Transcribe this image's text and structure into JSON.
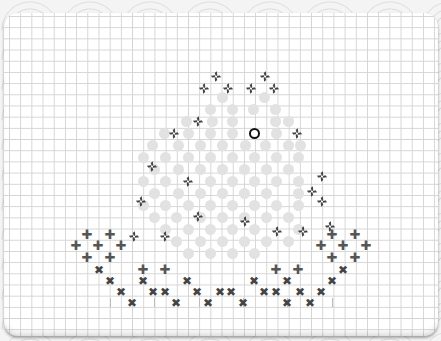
{
  "game": {
    "board": {
      "grid_size_px": 11.2
    },
    "cursor": {
      "x": 254,
      "y": 133
    },
    "pinwheels": [
      [
        216,
        76
      ],
      [
        265,
        76
      ],
      [
        204,
        88
      ],
      [
        228,
        88
      ],
      [
        251,
        88
      ],
      [
        274,
        88
      ],
      [
        198,
        121
      ],
      [
        174,
        133
      ],
      [
        297,
        133
      ],
      [
        152,
        166
      ],
      [
        188,
        181
      ],
      [
        322,
        176
      ],
      [
        312,
        191
      ],
      [
        141,
        201
      ],
      [
        322,
        201
      ],
      [
        198,
        216
      ],
      [
        165,
        236
      ],
      [
        245,
        221
      ],
      [
        277,
        231
      ],
      [
        303,
        231
      ],
      [
        134,
        236
      ],
      [
        330,
        226
      ]
    ],
    "dots": [
      [
        222,
        97
      ],
      [
        264,
        97
      ],
      [
        210,
        109
      ],
      [
        232,
        109
      ],
      [
        253,
        109
      ],
      [
        275,
        109
      ],
      [
        186,
        121
      ],
      [
        212,
        121
      ],
      [
        232,
        121
      ],
      [
        275,
        121
      ],
      [
        288,
        121
      ],
      [
        164,
        133
      ],
      [
        188,
        133
      ],
      [
        210,
        133
      ],
      [
        232,
        133
      ],
      [
        276,
        133
      ],
      [
        152,
        145
      ],
      [
        178,
        145
      ],
      [
        200,
        145
      ],
      [
        222,
        145
      ],
      [
        245,
        145
      ],
      [
        265,
        145
      ],
      [
        288,
        145
      ],
      [
        300,
        145
      ],
      [
        143,
        157
      ],
      [
        165,
        157
      ],
      [
        188,
        157
      ],
      [
        210,
        157
      ],
      [
        232,
        157
      ],
      [
        254,
        157
      ],
      [
        276,
        157
      ],
      [
        298,
        157
      ],
      [
        154,
        169
      ],
      [
        178,
        169
      ],
      [
        200,
        169
      ],
      [
        222,
        169
      ],
      [
        244,
        169
      ],
      [
        266,
        169
      ],
      [
        288,
        169
      ],
      [
        143,
        181
      ],
      [
        165,
        181
      ],
      [
        210,
        181
      ],
      [
        232,
        181
      ],
      [
        254,
        181
      ],
      [
        276,
        181
      ],
      [
        298,
        181
      ],
      [
        154,
        193
      ],
      [
        178,
        193
      ],
      [
        200,
        193
      ],
      [
        222,
        193
      ],
      [
        244,
        193
      ],
      [
        266,
        193
      ],
      [
        298,
        193
      ],
      [
        143,
        205
      ],
      [
        165,
        205
      ],
      [
        188,
        205
      ],
      [
        210,
        205
      ],
      [
        232,
        205
      ],
      [
        254,
        205
      ],
      [
        276,
        205
      ],
      [
        298,
        205
      ],
      [
        154,
        217
      ],
      [
        176,
        217
      ],
      [
        200,
        217
      ],
      [
        222,
        217
      ],
      [
        244,
        217
      ],
      [
        266,
        217
      ],
      [
        288,
        217
      ],
      [
        165,
        229
      ],
      [
        188,
        229
      ],
      [
        210,
        229
      ],
      [
        232,
        229
      ],
      [
        254,
        229
      ],
      [
        298,
        229
      ],
      [
        176,
        241
      ],
      [
        200,
        241
      ],
      [
        222,
        241
      ],
      [
        244,
        241
      ],
      [
        266,
        241
      ],
      [
        288,
        241
      ],
      [
        188,
        253
      ],
      [
        210,
        253
      ],
      [
        232,
        253
      ],
      [
        254,
        253
      ]
    ],
    "pluses": [
      [
        87,
        235
      ],
      [
        110,
        235
      ],
      [
        76,
        246
      ],
      [
        98,
        246
      ],
      [
        121,
        246
      ],
      [
        87,
        258
      ],
      [
        110,
        258
      ],
      [
        143,
        270
      ],
      [
        165,
        270
      ],
      [
        276,
        270
      ],
      [
        298,
        270
      ],
      [
        332,
        235
      ],
      [
        355,
        235
      ],
      [
        321,
        246
      ],
      [
        343,
        246
      ],
      [
        366,
        246
      ],
      [
        332,
        258
      ],
      [
        355,
        258
      ]
    ],
    "crosses": [
      [
        99,
        270
      ],
      [
        110,
        281
      ],
      [
        121,
        292
      ],
      [
        132,
        303
      ],
      [
        143,
        281
      ],
      [
        153,
        292
      ],
      [
        165,
        292
      ],
      [
        176,
        303
      ],
      [
        187,
        281
      ],
      [
        197,
        292
      ],
      [
        208,
        303
      ],
      [
        220,
        292
      ],
      [
        231,
        292
      ],
      [
        243,
        303
      ],
      [
        254,
        281
      ],
      [
        264,
        292
      ],
      [
        276,
        292
      ],
      [
        287,
        281
      ],
      [
        287,
        303
      ],
      [
        300,
        292
      ],
      [
        310,
        303
      ],
      [
        321,
        292
      ],
      [
        332,
        281
      ],
      [
        343,
        270
      ]
    ],
    "ticks": [
      [
        110,
        302
      ],
      [
        154,
        302
      ],
      [
        199,
        302
      ],
      [
        243,
        302
      ],
      [
        287,
        302
      ],
      [
        332,
        302
      ]
    ]
  }
}
